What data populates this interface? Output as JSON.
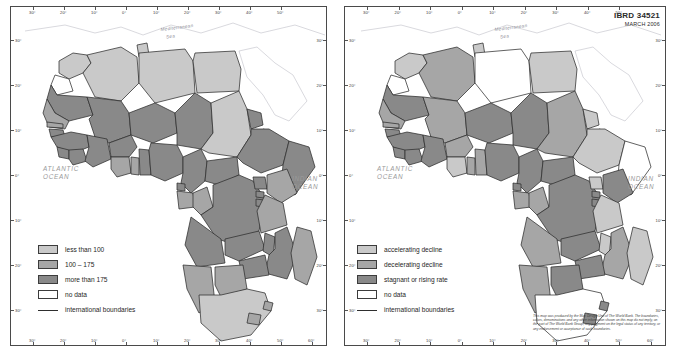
{
  "sheet": {
    "id_block": {
      "ibrd": "IBRD 34521",
      "date": "MARCH 2006"
    },
    "disclaimer": "This map was produced by the Map Design Unit of The World Bank. The boundaries, colors, denominations and any other information shown on this map do not imply, on the part of The World Bank Group, any judgment on the legal status of any territory, or any endorsement or acceptance of such boundaries."
  },
  "palette": {
    "light": "#c9c9c9",
    "medium": "#a6a6a6",
    "dark": "#898989",
    "none": "#ffffff",
    "boundary": "#2e2e2e",
    "coast": "#6e6e6e",
    "frame": "#4a4a4a",
    "ocean_label": "#9a9a9a"
  },
  "left_map": {
    "name": "under-five-mortality-rate",
    "geo_labels": [
      {
        "name": "atlantic-ocean-label",
        "text": "ATLANTIC\nOCEAN"
      },
      {
        "name": "indian-ocean-label",
        "text": "INDIAN\nOCEAN"
      },
      {
        "name": "mediterranean-sea-label",
        "text": "Mediterranean\nSea"
      }
    ],
    "ticks_top": [
      "30°",
      "20°",
      "10°",
      "0°",
      "10°",
      "20°",
      "30°",
      "40°",
      "50°"
    ],
    "ticks_bottom": [
      "30°",
      "20°",
      "10°",
      "0°",
      "10°",
      "20°",
      "30°",
      "40°",
      "50°",
      "60°"
    ],
    "ticks_left": [
      "30°",
      "20°",
      "10°",
      "0°",
      "10°",
      "20°",
      "30°"
    ],
    "ticks_right": [
      "30°",
      "20°",
      "10°",
      "0°",
      "10°",
      "20°",
      "30°"
    ],
    "legend": [
      {
        "label": "less than 100",
        "swatch": "light",
        "kind": "box"
      },
      {
        "label": "100 – 175",
        "swatch": "medium",
        "kind": "box"
      },
      {
        "label": "more than 175",
        "swatch": "dark",
        "kind": "box"
      },
      {
        "label": "no data",
        "swatch": "none",
        "kind": "box"
      },
      {
        "label": "international boundaries",
        "swatch": "",
        "kind": "line"
      }
    ]
  },
  "right_map": {
    "name": "mortality-rate-trend",
    "geo_labels": [
      {
        "name": "atlantic-ocean-label",
        "text": "ATLANTIC\nOCEAN"
      },
      {
        "name": "indian-ocean-label",
        "text": "INDIAN\nOCEAN"
      },
      {
        "name": "mediterranean-sea-label",
        "text": "Mediterranean\nSea"
      }
    ],
    "ticks_top": [
      "30°",
      "20°",
      "10°",
      "0°",
      "10°",
      "20°",
      "30°",
      "40°",
      "50°"
    ],
    "ticks_bottom": [
      "30°",
      "20°",
      "10°",
      "0°",
      "10°",
      "20°",
      "30°",
      "40°",
      "50°",
      "60°"
    ],
    "ticks_left": [
      "30°",
      "20°",
      "10°",
      "0°",
      "10°",
      "20°",
      "30°"
    ],
    "ticks_right": [
      "30°",
      "20°",
      "10°",
      "0°",
      "10°",
      "20°",
      "30°"
    ],
    "legend": [
      {
        "label": "accelerating decline",
        "swatch": "light",
        "kind": "box"
      },
      {
        "label": "decelerating decline",
        "swatch": "medium",
        "kind": "box"
      },
      {
        "label": "stagnant or rising rate",
        "swatch": "dark",
        "kind": "box"
      },
      {
        "label": "no data",
        "swatch": "none",
        "kind": "box"
      },
      {
        "label": "international boundaries",
        "swatch": "",
        "kind": "line"
      }
    ]
  }
}
